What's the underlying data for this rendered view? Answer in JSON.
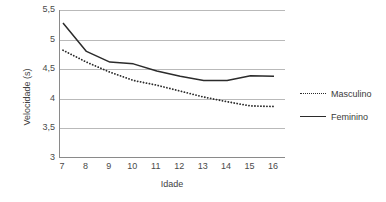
{
  "chart_data": {
    "type": "line",
    "title": "",
    "xlabel": "Idade",
    "ylabel": "Velocidade (s)",
    "categories": [
      7,
      8,
      9,
      10,
      11,
      12,
      13,
      14,
      15,
      16
    ],
    "x_tick_labels": [
      "7",
      "8",
      "9",
      "10",
      "11",
      "12",
      "13",
      "14",
      "15",
      "16"
    ],
    "y_tick_labels": [
      "5,5",
      "5",
      "4,5",
      "4",
      "3,5",
      "3"
    ],
    "y_tick_values": [
      5.5,
      5,
      4.5,
      4,
      3.5,
      3
    ],
    "ylim": [
      3,
      5.5
    ],
    "xlim": [
      7,
      16
    ],
    "grid": "horizontal",
    "legend_position": "right",
    "series": [
      {
        "name": "Masculino",
        "style": "dotted",
        "color": "#2b2b2b",
        "values": [
          4.82,
          4.62,
          4.45,
          4.31,
          4.23,
          4.13,
          4.03,
          3.95,
          3.88,
          3.87
        ]
      },
      {
        "name": "Feminino",
        "style": "solid",
        "color": "#2b2b2b",
        "values": [
          5.28,
          4.8,
          4.62,
          4.59,
          4.47,
          4.38,
          4.31,
          4.31,
          4.39,
          4.38
        ]
      }
    ]
  },
  "axes": {
    "y_title": "Velocidade (s)",
    "x_title": "Idade"
  },
  "legend": {
    "items": [
      {
        "label": "Masculino"
      },
      {
        "label": "Feminino"
      }
    ]
  }
}
